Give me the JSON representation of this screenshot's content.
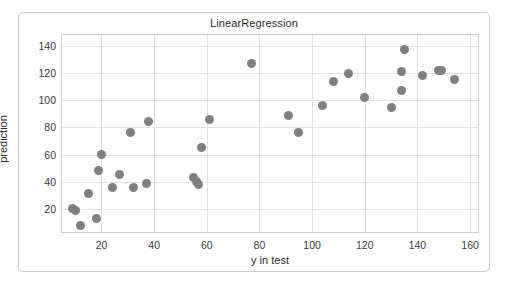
{
  "chart_data": {
    "type": "scatter",
    "title": "LinearRegression",
    "xlabel": "y in test",
    "ylabel": "prediction",
    "xlim": [
      5,
      163
    ],
    "ylim": [
      3,
      148
    ],
    "xticks": [
      20,
      40,
      60,
      80,
      100,
      120,
      140,
      160
    ],
    "yticks": [
      20,
      40,
      60,
      80,
      100,
      120,
      140
    ],
    "grid": true,
    "legend": null,
    "marker": {
      "shape": "circle",
      "color": "#808080",
      "size": 9
    },
    "series": [
      {
        "name": "predictions",
        "points": [
          {
            "x": 9,
            "y": 20
          },
          {
            "x": 10,
            "y": 19
          },
          {
            "x": 12,
            "y": 8
          },
          {
            "x": 15,
            "y": 31
          },
          {
            "x": 18,
            "y": 13
          },
          {
            "x": 19,
            "y": 48
          },
          {
            "x": 20,
            "y": 60
          },
          {
            "x": 24,
            "y": 36
          },
          {
            "x": 27,
            "y": 45
          },
          {
            "x": 31,
            "y": 76
          },
          {
            "x": 32,
            "y": 36
          },
          {
            "x": 37,
            "y": 39
          },
          {
            "x": 38,
            "y": 84
          },
          {
            "x": 55,
            "y": 43
          },
          {
            "x": 56,
            "y": 40
          },
          {
            "x": 57,
            "y": 38
          },
          {
            "x": 58,
            "y": 65
          },
          {
            "x": 61,
            "y": 86
          },
          {
            "x": 77,
            "y": 127
          },
          {
            "x": 91,
            "y": 89
          },
          {
            "x": 95,
            "y": 76
          },
          {
            "x": 104,
            "y": 96
          },
          {
            "x": 108,
            "y": 114
          },
          {
            "x": 114,
            "y": 120
          },
          {
            "x": 120,
            "y": 102
          },
          {
            "x": 130,
            "y": 95
          },
          {
            "x": 134,
            "y": 107
          },
          {
            "x": 134,
            "y": 121
          },
          {
            "x": 135,
            "y": 137
          },
          {
            "x": 142,
            "y": 118
          },
          {
            "x": 148,
            "y": 122
          },
          {
            "x": 149,
            "y": 122
          },
          {
            "x": 154,
            "y": 115
          }
        ]
      }
    ]
  }
}
